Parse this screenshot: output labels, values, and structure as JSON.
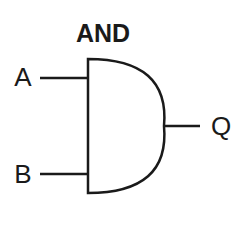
{
  "diagram": {
    "title": "AND",
    "gate_type": "AND",
    "inputs": [
      {
        "label": "A"
      },
      {
        "label": "B"
      }
    ],
    "output": {
      "label": "Q"
    },
    "colors": {
      "stroke": "#1a1a1a",
      "background": "#ffffff"
    }
  }
}
